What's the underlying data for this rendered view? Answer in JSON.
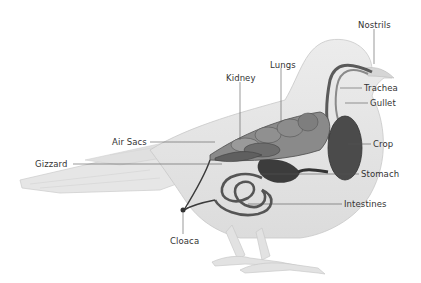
{
  "diagram": {
    "labels": [
      {
        "id": "nostrils",
        "text": "Nostrils",
        "x": 358,
        "y": 20
      },
      {
        "id": "lungs",
        "text": "Lungs",
        "x": 270,
        "y": 60
      },
      {
        "id": "kidney",
        "text": "Kidney",
        "x": 226,
        "y": 73
      },
      {
        "id": "trachea",
        "text": "Trachea",
        "x": 364,
        "y": 84
      },
      {
        "id": "gullet",
        "text": "Gullet",
        "x": 370,
        "y": 98
      },
      {
        "id": "air_sacs",
        "text": "Air Sacs",
        "x": 112,
        "y": 136
      },
      {
        "id": "crop",
        "text": "Crop",
        "x": 373,
        "y": 137
      },
      {
        "id": "gizzard",
        "text": "Gizzard",
        "x": 35,
        "y": 160
      },
      {
        "id": "stomach",
        "text": "Stomach",
        "x": 361,
        "y": 167
      },
      {
        "id": "intestines",
        "text": "Intestines",
        "x": 344,
        "y": 197
      },
      {
        "id": "cloaca",
        "text": "Cloaca",
        "x": 170,
        "y": 236
      }
    ],
    "colors": {
      "background": "#ffffff",
      "body": "#e4e4e4",
      "body_outline": "#c8c8c8",
      "organ_dark": "#4a4a4a",
      "organ_mid": "#7a7a7a",
      "leader_line": "#555555",
      "text": "#333333"
    }
  }
}
